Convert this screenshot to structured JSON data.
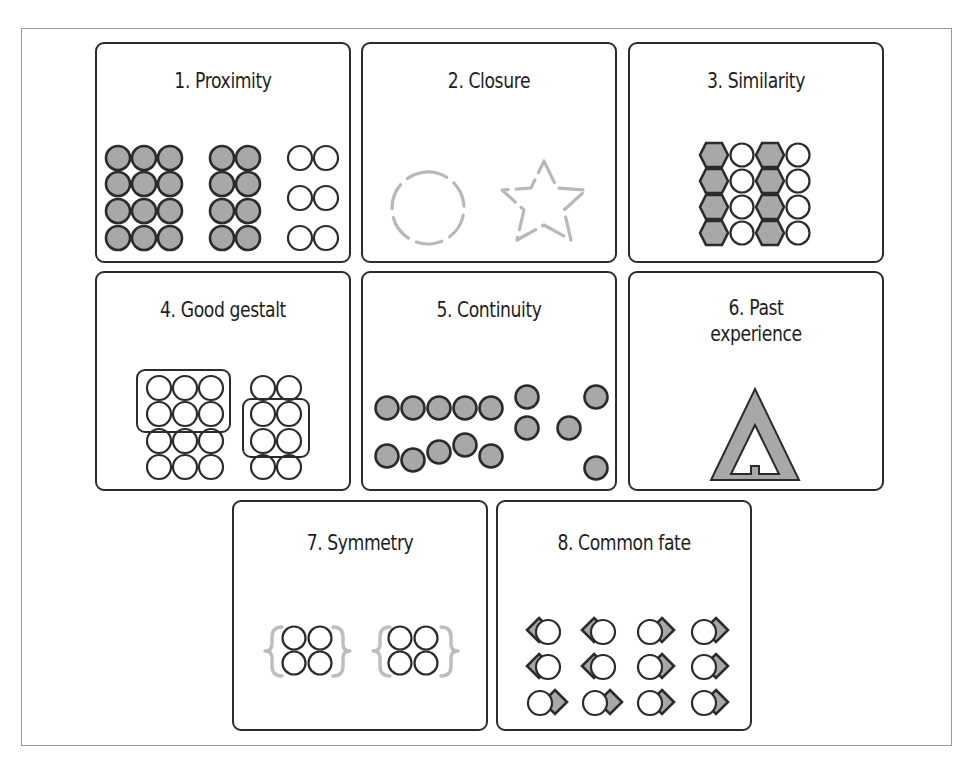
{
  "figure": {
    "colors": {
      "stroke": "#2b2b2b",
      "fill_gray": "#a8a8a8",
      "dashed_gray": "#b5b5b5",
      "white": "#ffffff",
      "frame": "#9a9a9a"
    },
    "panels": [
      {
        "id": 1,
        "label": "1. Proximity",
        "lines": [
          "1. Proximity"
        ]
      },
      {
        "id": 2,
        "label": "2. Closure",
        "lines": [
          "2. Closure"
        ]
      },
      {
        "id": 3,
        "label": "3. Similarity",
        "lines": [
          "3. Similarity"
        ]
      },
      {
        "id": 4,
        "label": "4. Good gestalt",
        "lines": [
          "4. Good gestalt"
        ]
      },
      {
        "id": 5,
        "label": "5. Continuity",
        "lines": [
          "5. Continuity"
        ]
      },
      {
        "id": 6,
        "label": "6. Past experience",
        "lines": [
          "6. Past",
          "experience"
        ]
      },
      {
        "id": 7,
        "label": "7. Symmetry",
        "lines": [
          "7. Symmetry"
        ]
      },
      {
        "id": 8,
        "label": "8. Common fate",
        "lines": [
          "8. Common fate"
        ]
      }
    ]
  }
}
